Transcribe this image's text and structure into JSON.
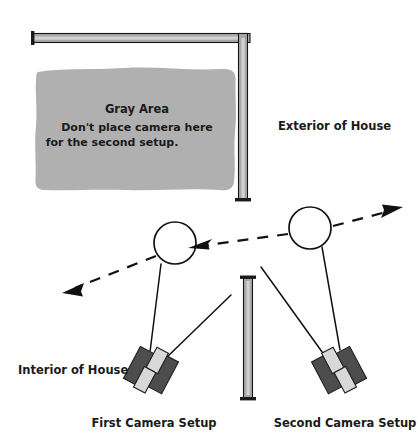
{
  "diagram": {
    "title_note": "Camera placement floor plan",
    "colors": {
      "gray_area_fill": "#b0b0b0",
      "wall_fill": "#a8a8a8",
      "wall_stroke": "#141414",
      "camera_body": "#4d4d4d",
      "camera_lens": "#d8d8d8",
      "line": "#111111",
      "text": "#1a1a1a",
      "background": "#ffffff"
    },
    "gray_area": {
      "title": "Gray Area",
      "line1": "Don't place camera here",
      "line2": "for the second setup."
    },
    "labels": {
      "exterior": "Exterior of House",
      "interior": "Interior of House",
      "first_camera": "First Camera Setup",
      "second_camera": "Second Camera Setup"
    },
    "subjects": [
      {
        "name": "subject-left",
        "cx": 175,
        "cy": 243,
        "r": 21
      },
      {
        "name": "subject-right",
        "cx": 310,
        "cy": 228,
        "r": 21
      }
    ],
    "cameras": [
      {
        "name": "first-camera",
        "x": 155,
        "y": 370,
        "rotation_deg": 28
      },
      {
        "name": "second-camera",
        "x": 335,
        "y": 370,
        "rotation_deg": -28
      }
    ],
    "walls": [
      {
        "name": "exterior-wall-horizontal",
        "x1": 33,
        "y1": 38,
        "x2": 250,
        "y2": 38
      },
      {
        "name": "exterior-wall-vertical",
        "x1": 243,
        "y1": 38,
        "x2": 243,
        "y2": 200
      },
      {
        "name": "interior-divider-wall",
        "x1": 248,
        "y1": 277,
        "x2": 248,
        "y2": 400
      }
    ],
    "arrows": [
      {
        "name": "light-direction-left",
        "direction": "down-left"
      },
      {
        "name": "light-direction-center",
        "direction": "left"
      },
      {
        "name": "light-direction-upper-right",
        "direction": "up-right"
      }
    ]
  }
}
